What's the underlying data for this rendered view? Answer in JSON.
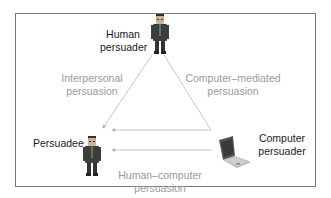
{
  "diagram": {
    "nodes": {
      "human_persuader": {
        "label_line1": "Human",
        "label_line2": "persuader",
        "icon": "person-icon"
      },
      "persuadee": {
        "label": "Persuadee",
        "icon": "person-icon"
      },
      "computer_persuader": {
        "label_line1": "Computer",
        "label_line2": "persuader",
        "icon": "laptop-icon"
      }
    },
    "edges": {
      "interpersonal": {
        "label_line1": "Interpersonal",
        "label_line2": "persuasion",
        "from": "Human persuader",
        "to": "Persuadee"
      },
      "computer_mediated": {
        "label_line1": "Computer–mediated",
        "label_line2": "persuasion",
        "from": "Human persuader",
        "to": "Persuadee via Computer persuader"
      },
      "human_computer": {
        "label_line1": "Human–computer",
        "label_line2": "persuasion",
        "from": "Computer persuader",
        "to": "Persuadee"
      }
    },
    "colors": {
      "frame": "#777777",
      "edge_line": "#b5b5b5",
      "edge_label": "#9a9a9a",
      "node_label": "#1a1a1a",
      "suit": "#3a3f3c"
    }
  }
}
